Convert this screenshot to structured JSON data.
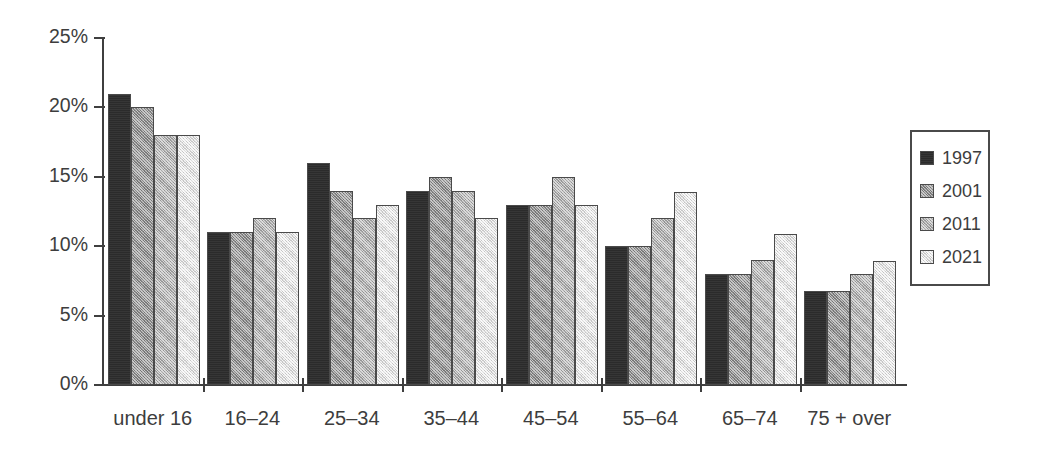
{
  "chart_data": {
    "type": "bar",
    "title": "",
    "subtitle": "",
    "xlabel": "",
    "ylabel": "",
    "ylim": [
      0,
      25
    ],
    "ytick_values": [
      0,
      5,
      10,
      15,
      20,
      25
    ],
    "ytick_labels": [
      "0%",
      "5%",
      "10%",
      "15%",
      "20%",
      "25%"
    ],
    "grid": false,
    "legend_position": "right",
    "categories": [
      "under 16",
      "16–24",
      "25–34",
      "35–44",
      "45–54",
      "55–64",
      "65–74",
      "75 + over"
    ],
    "series": [
      {
        "name": "1997",
        "color": "#2b2b2b",
        "values": [
          21,
          11,
          16,
          14,
          13,
          10,
          8,
          6.8
        ]
      },
      {
        "name": "2001",
        "color": "#8c8c8c",
        "values": [
          20,
          11,
          14,
          15,
          13,
          10,
          8,
          6.8
        ]
      },
      {
        "name": "2011",
        "color": "#ababab",
        "values": [
          18,
          12,
          12,
          14,
          15,
          12,
          9,
          8
        ]
      },
      {
        "name": "2021",
        "color": "#dcdcdc",
        "values": [
          18,
          11,
          13,
          12,
          13,
          13.9,
          10.9,
          8.9
        ]
      }
    ]
  },
  "axis": {
    "tick_color": "#3f3f3f",
    "line_color": "#3f3f3f"
  },
  "legend": {
    "entries": [
      {
        "label": "1997"
      },
      {
        "label": "2001"
      },
      {
        "label": "2011"
      },
      {
        "label": "2021"
      }
    ]
  }
}
